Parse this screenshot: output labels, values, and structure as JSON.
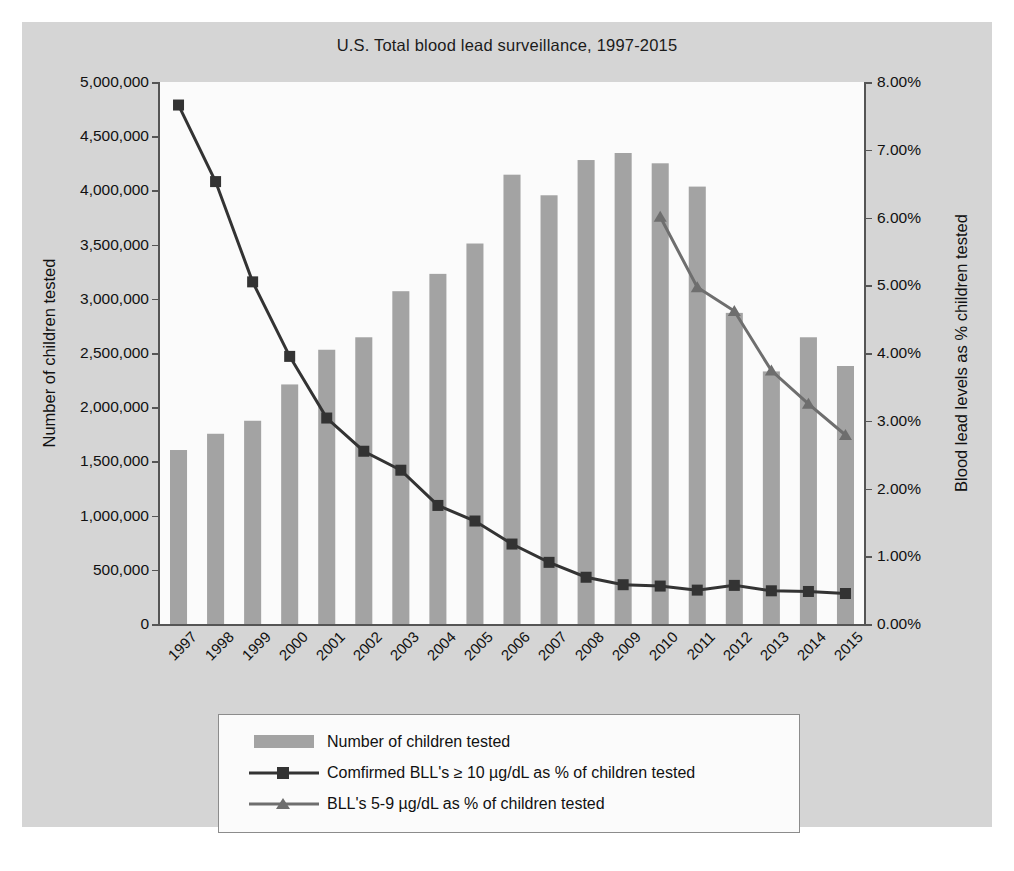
{
  "chart_data": {
    "type": "bar",
    "title": "U.S. Total blood lead surveillance, 1997-2015",
    "xlabel": "",
    "ylabel": "Number of children tested",
    "y2label": "Blood lead levels as % children tested",
    "grid": false,
    "legend_position": "bottom",
    "ylim": [
      0,
      5000000
    ],
    "y2lim": [
      0,
      0.08
    ],
    "yticks": [
      "0",
      "500,000",
      "1,000,000",
      "1,500,000",
      "2,000,000",
      "2,500,000",
      "3,000,000",
      "3,500,000",
      "4,000,000",
      "4,500,000",
      "5,000,000"
    ],
    "ytick_values": [
      0,
      500000,
      1000000,
      1500000,
      2000000,
      2500000,
      3000000,
      3500000,
      4000000,
      4500000,
      5000000
    ],
    "y2ticks": [
      "0.00%",
      "1.00%",
      "2.00%",
      "3.00%",
      "4.00%",
      "5.00%",
      "6.00%",
      "7.00%",
      "8.00%"
    ],
    "y2tick_values": [
      0,
      1,
      2,
      3,
      4,
      5,
      6,
      7,
      8
    ],
    "categories": [
      "1997",
      "1998",
      "1999",
      "2000",
      "2001",
      "2002",
      "2003",
      "2004",
      "2005",
      "2006",
      "2007",
      "2008",
      "2009",
      "2010",
      "2011",
      "2012",
      "2013",
      "2014",
      "2015"
    ],
    "series": [
      {
        "name": "Number of children tested",
        "type": "bar",
        "axis": "left",
        "color": "#a3a3a3",
        "values": [
          1605000,
          1755000,
          1875000,
          2210000,
          2530000,
          2645000,
          3070000,
          3230000,
          3510000,
          4145000,
          3955000,
          4280000,
          4345000,
          4250000,
          4035000,
          2870000,
          2330000,
          2645000,
          2380000
        ]
      },
      {
        "name": "Comfirmed BLL's ≥ 10 µg/dL as % of children tested",
        "type": "line",
        "axis": "right",
        "color": "#333333",
        "marker": "square",
        "values": [
          7.66,
          6.53,
          5.05,
          3.95,
          3.04,
          2.55,
          2.27,
          1.75,
          1.52,
          1.18,
          0.91,
          0.69,
          0.58,
          0.56,
          0.5,
          0.57,
          0.49,
          0.48,
          0.45
        ]
      },
      {
        "name": "BLL's 5-9 µg/dL as % of children tested",
        "type": "line",
        "axis": "right",
        "color": "#6e6e6e",
        "marker": "triangle",
        "values": [
          null,
          null,
          null,
          null,
          null,
          null,
          null,
          null,
          null,
          null,
          null,
          null,
          null,
          6.01,
          4.97,
          4.62,
          3.74,
          3.25,
          2.79
        ]
      }
    ]
  },
  "legend": {
    "items": [
      {
        "key": "bar-swatch",
        "label": "Number of children tested"
      },
      {
        "key": "line-square",
        "label": "Comfirmed BLL's ≥ 10 µg/dL as % of children tested"
      },
      {
        "key": "line-triangle",
        "label": "BLL's 5-9 µg/dL as % of children tested"
      }
    ]
  },
  "colors": {
    "panel_background": "#d5d5d5",
    "plot_background": "#fbfbfb",
    "bar": "#a3a3a3",
    "line_confirmed": "#333333",
    "line_bll59": "#6e6e6e",
    "axis": "#555555",
    "text": "#111111"
  }
}
